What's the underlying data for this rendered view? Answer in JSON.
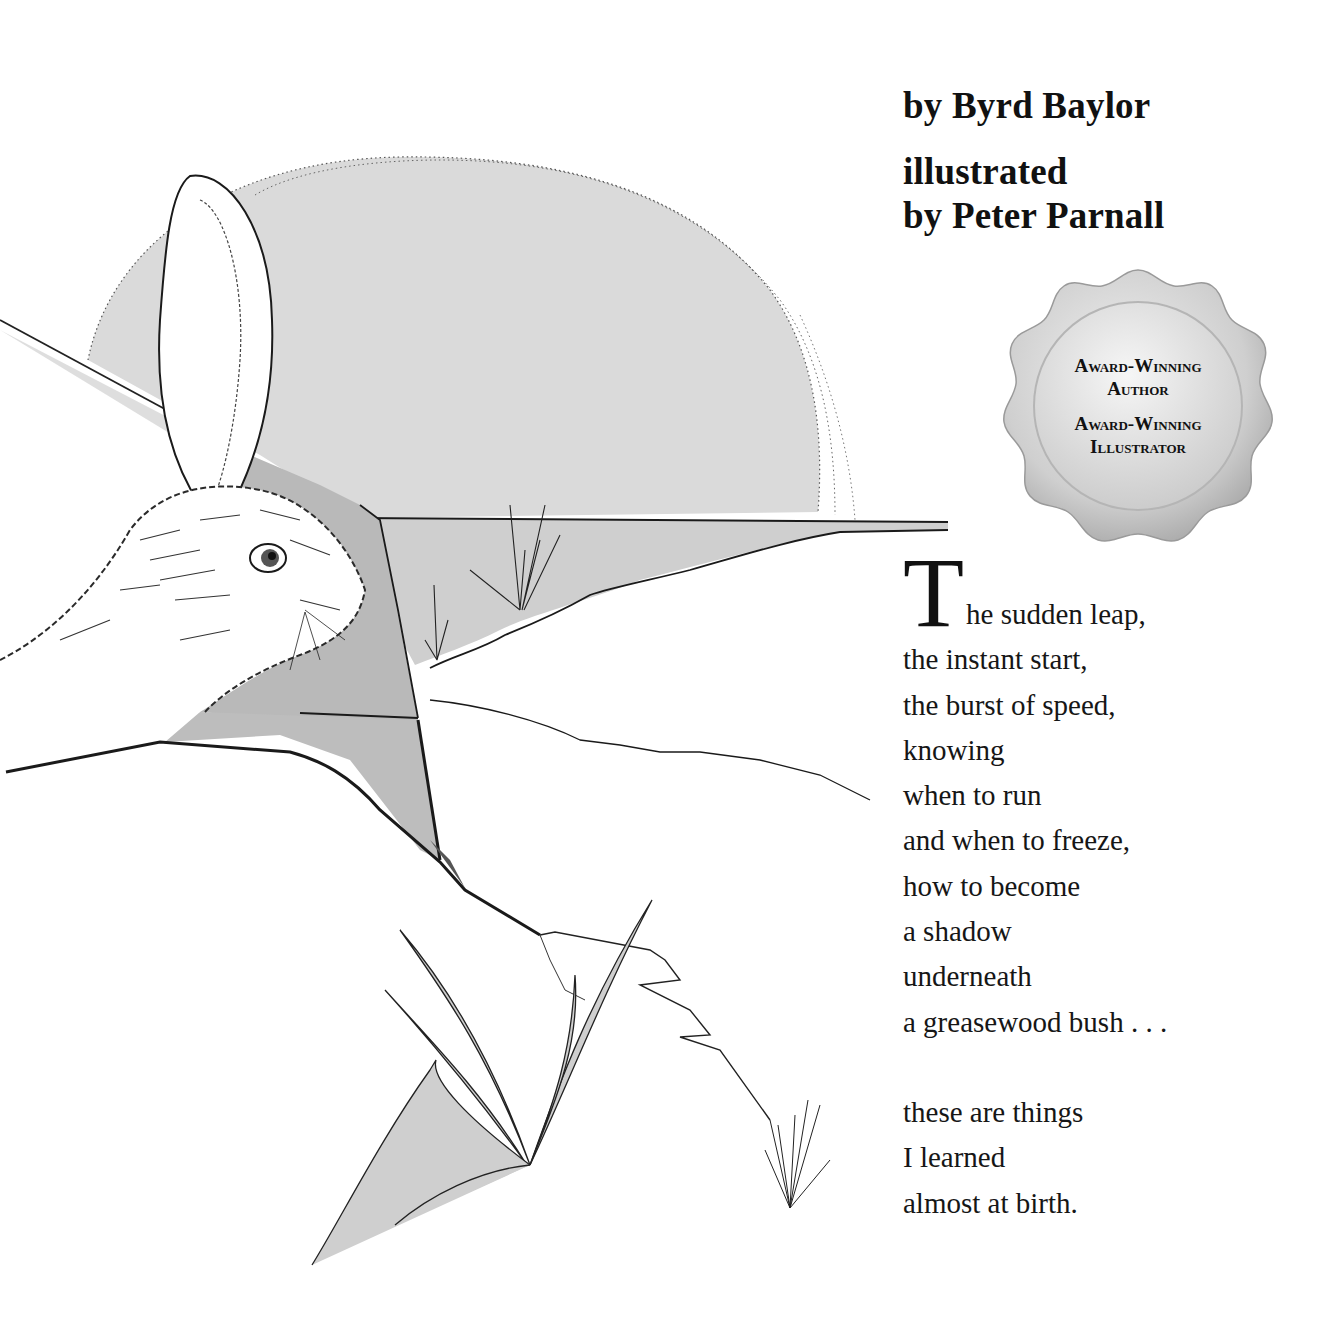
{
  "credits": {
    "author": "by Byrd Baylor",
    "illustrator_line1": "illustrated",
    "illustrator_line2": "by Peter Parnall"
  },
  "seal": {
    "line1": "Award-Winning",
    "line2": "Author",
    "line3": "Award-Winning",
    "line4": "Illustrator"
  },
  "poem": {
    "drop_cap": "T",
    "first_line_rest": "he sudden leap,",
    "stanza1": [
      "the instant start,",
      "the burst of speed,",
      "knowing",
      "when to run",
      "and when to freeze,",
      "how to become",
      "a shadow",
      "underneath",
      "a greasewood bush . . ."
    ],
    "stanza2": [
      "these are things",
      "I learned",
      "almost at birth."
    ]
  },
  "illustration": {
    "subject": "jackrabbit-with-setting-sun-desert-scene",
    "colors": {
      "sun": "#d9d9d9",
      "rock": "#bdbdbd",
      "water": "#d2d2d2",
      "ink": "#1a1a1a"
    }
  }
}
